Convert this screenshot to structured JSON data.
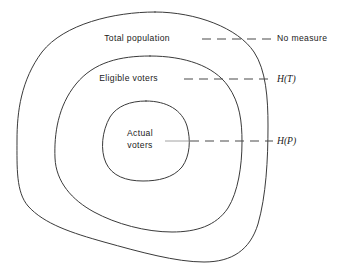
{
  "figure": {
    "background_color": "#ffffff",
    "stroke_color": "#3a3a3a",
    "dash_color": "#4a4a4a"
  },
  "regions": [
    {
      "id": "total-population",
      "label": "Total population",
      "label_x": 170,
      "label_y": 41,
      "right_label": "No measure",
      "right_label_x": 277,
      "right_label_y": 41,
      "leader_y": 39,
      "leader_x_start": 202,
      "leader_x_end": 274,
      "level": 1
    },
    {
      "id": "eligible-voters",
      "label": "Eligible voters",
      "label_x": 158,
      "label_y": 81,
      "right_label": "H(T)",
      "right_label_x": 277,
      "right_label_y": 82,
      "leader_y": 79,
      "leader_x_start": 184,
      "leader_x_end": 273,
      "level": 2
    },
    {
      "id": "actual-voters",
      "label_line1": "Actual",
      "label_line2": "voters",
      "label_x": 140,
      "label_y1": 136,
      "label_y2": 148,
      "right_label": "H(P)",
      "right_label_x": 277,
      "right_label_y": 144,
      "leader_y": 141,
      "leader_x_start": 165,
      "leader_x_end": 273,
      "level": 3
    }
  ],
  "contours": {
    "outer": {
      "name": "total-population-contour",
      "path": "M 155 12 C 196 12 238 28 254 52 C 266 70 268 98 268 126 C 268 160 266 196 258 224 C 250 250 232 262 204 262 C 176 262 140 252 104 242 C 72 233 44 224 28 206 C 16 192 17 168 17 140 C 17 112 21 80 42 52 C 64 24 114 12 155 12 Z"
    },
    "middle": {
      "name": "eligible-voters-contour",
      "path": "M 150 56 C 185 56 214 66 228 86 C 240 103 242 122 242 142 C 242 166 238 192 228 208 C 216 226 196 232 172 232 C 146 232 116 224 94 212 C 72 200 56 182 55 158 C 54 134 58 106 76 84 C 94 62 120 56 150 56 Z"
    },
    "inner": {
      "name": "actual-voters-contour",
      "path": "M 146 101 C 167 101 182 110 187 126 C 191 140 190 156 182 167 C 173 178 158 181 143 181 C 126 181 112 176 106 163 C 100 150 102 131 110 117 C 117 106 130 101 146 101 Z"
    }
  }
}
